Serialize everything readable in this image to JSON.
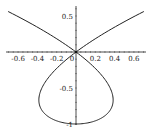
{
  "chart_data": {
    "type": "line",
    "title": "",
    "xlabel": "",
    "ylabel": "",
    "xlim": [
      -0.7,
      0.7
    ],
    "ylim": [
      -1.0,
      0.57
    ],
    "grid": false,
    "legend": null,
    "curve": {
      "description": "parametric curve x = t^3 - t, y = t^2 - 1",
      "t_range": [
        -1.25,
        1.25
      ],
      "color": "#222222"
    },
    "x_ticks": [
      {
        "value": -0.6,
        "label": "-0.6"
      },
      {
        "value": -0.4,
        "label": "-0.4"
      },
      {
        "value": -0.2,
        "label": "-0.2"
      },
      {
        "value": 0,
        "label": "0"
      },
      {
        "value": 0.2,
        "label": "0.2"
      },
      {
        "value": 0.4,
        "label": "0.4"
      },
      {
        "value": 0.6,
        "label": "0.6"
      }
    ],
    "y_ticks": [
      {
        "value": 0.5,
        "label": "0.5"
      },
      {
        "value": -0.5,
        "label": "-0.5"
      },
      {
        "value": -1,
        "label": "-1"
      }
    ],
    "series": [
      {
        "name": "curve",
        "points": [
          [
            -0.703,
            0.5625
          ],
          [
            -0.515,
            0.44
          ],
          [
            -0.353,
            0.322
          ],
          [
            -0.216,
            0.21
          ],
          [
            -0.102,
            0.103
          ],
          [
            0.0,
            0.0
          ],
          [
            0.081,
            -0.0975
          ],
          [
            0.148,
            -0.19
          ],
          [
            0.2,
            -0.2775
          ],
          [
            0.241,
            -0.36
          ],
          [
            0.271,
            -0.4375
          ],
          [
            0.292,
            -0.51
          ],
          [
            0.305,
            -0.5775
          ],
          [
            0.311,
            -0.64
          ],
          [
            0.312,
            -0.6975
          ],
          [
            0.308,
            -0.75
          ],
          [
            0.3,
            -0.7975
          ],
          [
            0.288,
            -0.84
          ],
          [
            0.274,
            -0.8775
          ],
          [
            0.259,
            -0.91
          ],
          [
            0.243,
            -0.9375
          ],
          [
            0.225,
            -0.96
          ],
          [
            0.188,
            -0.9775
          ],
          [
            0.143,
            -0.99
          ],
          [
            0.097,
            -0.9975
          ],
          [
            0.0,
            -1.0
          ],
          [
            -0.097,
            -0.9975
          ],
          [
            -0.143,
            -0.99
          ],
          [
            -0.188,
            -0.9775
          ],
          [
            -0.225,
            -0.96
          ],
          [
            -0.243,
            -0.9375
          ],
          [
            -0.259,
            -0.91
          ],
          [
            -0.274,
            -0.8775
          ],
          [
            -0.288,
            -0.84
          ],
          [
            -0.3,
            -0.7975
          ],
          [
            -0.308,
            -0.75
          ],
          [
            -0.312,
            -0.6975
          ],
          [
            -0.311,
            -0.64
          ],
          [
            -0.305,
            -0.5775
          ],
          [
            -0.292,
            -0.51
          ],
          [
            -0.271,
            -0.4375
          ],
          [
            -0.241,
            -0.36
          ],
          [
            -0.2,
            -0.2775
          ],
          [
            -0.148,
            -0.19
          ],
          [
            -0.081,
            -0.0975
          ],
          [
            0.0,
            0.0
          ],
          [
            0.102,
            0.103
          ],
          [
            0.216,
            0.21
          ],
          [
            0.353,
            0.322
          ],
          [
            0.515,
            0.44
          ],
          [
            0.703,
            0.5625
          ]
        ]
      }
    ]
  },
  "layout": {
    "origin_px": [
      76,
      52
    ],
    "x_px_per_unit": 96.5,
    "y_px_per_unit": 72,
    "x_axis_range_px": [
      6,
      146
    ],
    "y_axis_range_px": [
      6,
      125
    ],
    "axis_color": "#222222"
  }
}
